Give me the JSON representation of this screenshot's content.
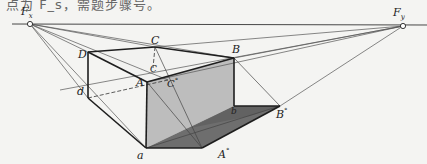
{
  "header_fragment": "点为 F_s，需题步骤号。",
  "labels": {
    "Fx": "F",
    "Fx_sub": "x",
    "Fy": "F",
    "Fy_sub": "y",
    "C_top": "C",
    "D": "D",
    "B": "B",
    "A": "A",
    "C_mid": "C",
    "C_deg": "C",
    "d": "d",
    "a": "a",
    "b": "b",
    "A_deg": "A",
    "B_deg": "B",
    "degree_mark": "°"
  },
  "colors": {
    "background": "#f4f4f2",
    "line": "#222222",
    "thin_line": "#444444",
    "light_face": "#b9b9b9",
    "dark_face": "#6b6b6b",
    "shadow_right": "#555555"
  },
  "points": {
    "Fx": [
      30,
      24
    ],
    "Fy": [
      403,
      26
    ],
    "C": [
      155,
      47
    ],
    "D": [
      88,
      52
    ],
    "B": [
      234,
      58
    ],
    "A": [
      147,
      82
    ],
    "c": [
      153,
      68
    ],
    "C_deg": [
      168,
      80
    ],
    "d": [
      88,
      98
    ],
    "a": [
      146,
      148
    ],
    "A_deg": [
      202,
      148
    ],
    "b": [
      234,
      106
    ],
    "B_deg": [
      280,
      106
    ]
  }
}
